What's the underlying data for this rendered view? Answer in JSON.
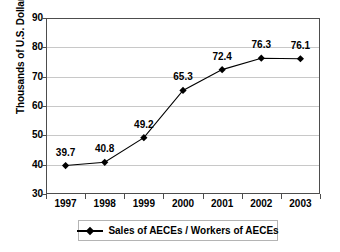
{
  "chart_data": {
    "type": "line",
    "title": "",
    "subtitle": "",
    "xlabel": "",
    "ylabel": "Thousands of U.S. Dollars",
    "categories": [
      "1997",
      "1998",
      "1999",
      "2000",
      "2001",
      "2002",
      "2003"
    ],
    "series": [
      {
        "name": "Sales of AECEs / Workers of AECEs",
        "values": [
          39.7,
          40.8,
          49.2,
          65.3,
          72.4,
          76.3,
          76.1
        ],
        "marker": "diamond",
        "color": "#000000"
      }
    ],
    "point_labels": [
      "39.7",
      "40.8",
      "49.2",
      "65.3",
      "72.4",
      "76.3",
      "76.1"
    ],
    "ylim": [
      30,
      90
    ],
    "yticks": [
      30,
      40,
      50,
      60,
      70,
      80,
      90
    ],
    "ytick_labels": [
      "30",
      "40",
      "50",
      "60",
      "70",
      "80",
      "90"
    ],
    "grid": true,
    "grid_axis": "y",
    "legend_position": "bottom",
    "legend_entries": [
      "Sales of AECEs / Workers of AECEs"
    ],
    "data_labels_shown": true,
    "background_color": "#ffffff",
    "plot_border_color": "#4d4d4d",
    "gridline_color": "#c8c8c8"
  }
}
